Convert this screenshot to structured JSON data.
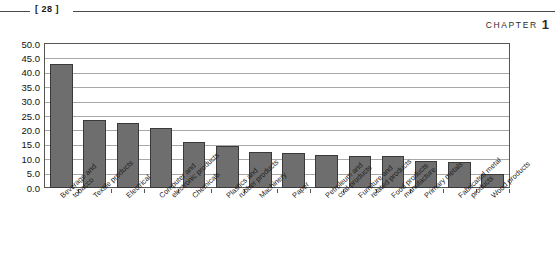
{
  "page_header": {
    "folio": "[ 28 ]",
    "chapter_word": "CHAPTER",
    "chapter_number": "1"
  },
  "colors": {
    "bar_fill": "#6e6e6e",
    "bar_stroke": "#3a3a3a",
    "gridline": "#a8a8a8",
    "frame": "#555555",
    "text": "#1a1a1a"
  },
  "chart_data": {
    "type": "bar",
    "title": "",
    "xlabel": "",
    "ylabel": "",
    "ylim": [
      0,
      50
    ],
    "ytick_labels": [
      "50.0",
      "45.0",
      "40.0",
      "35.0",
      "30.0",
      "25.0",
      "20.0",
      "15.0",
      "10.0",
      "5.0",
      "0.0"
    ],
    "ytick_values": [
      50,
      45,
      40,
      35,
      30,
      25,
      20,
      15,
      10,
      5,
      0
    ],
    "grid": true,
    "legend": "none",
    "categories": [
      "Beverage and tobacco",
      "Textile products",
      "Electrical",
      "Computer and electronic products",
      "Chemicals",
      "Plastics and rubber products",
      "Machinery",
      "Paper",
      "Petroleum and coal products",
      "Furniture and related products",
      "Food products manufacture",
      "Primary metals",
      "Fabricated metal products",
      "Wood products"
    ],
    "category_lines": [
      [
        "Beverage and",
        "tobacco"
      ],
      [
        "Textile products",
        ""
      ],
      [
        "Electrical",
        ""
      ],
      [
        "Computer and",
        "electronic products"
      ],
      [
        "Chemicals",
        ""
      ],
      [
        "Plastics and",
        "rubber products"
      ],
      [
        "Machinery",
        ""
      ],
      [
        "Paper",
        ""
      ],
      [
        "Petroleum and",
        "coal products"
      ],
      [
        "Furniture and",
        "related products"
      ],
      [
        "Food products",
        "manufacture"
      ],
      [
        "Primary metals",
        ""
      ],
      [
        "Fabricated metal",
        "products"
      ],
      [
        "Wood products",
        ""
      ]
    ],
    "values": [
      43.0,
      23.5,
      22.5,
      21.0,
      16.0,
      14.5,
      12.5,
      12.0,
      11.5,
      11.0,
      11.0,
      9.5,
      9.0,
      5.0
    ]
  }
}
